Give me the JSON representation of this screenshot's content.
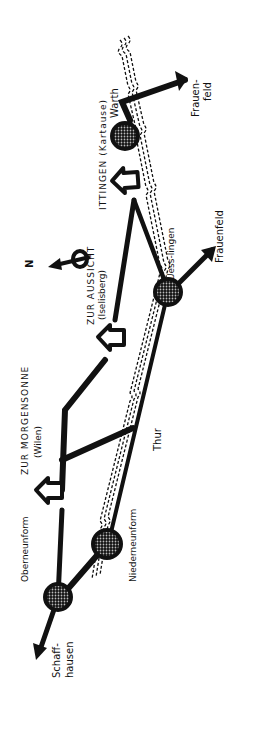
{
  "map": {
    "colors": {
      "ink": "#111111",
      "background": "#ffffff",
      "fill_pattern": "#888888"
    },
    "compass": {
      "label": "N",
      "icon": "north-arrow-icon"
    },
    "river": {
      "label": "Thur"
    },
    "towns": [
      {
        "id": "warth",
        "label": "Warth"
      },
      {
        "id": "uesslingen",
        "label": "Uess-lingen"
      },
      {
        "id": "niederneunforn",
        "label": "Niederneunform"
      },
      {
        "id": "oberneunforn",
        "label": "Oberneunform"
      }
    ],
    "destinations": [
      {
        "id": "frauenfeld-north",
        "label_line1": "Frauen-",
        "label_line2": "feld"
      },
      {
        "id": "frauenfeld-south",
        "label": "Frauenfeld"
      },
      {
        "id": "schaffhausen",
        "label_line1": "Schaff-",
        "label_line2": "hausen"
      }
    ],
    "inns": [
      {
        "id": "ittingen",
        "label_line1": "ITTINGEN (Kartause)",
        "label_line2": ""
      },
      {
        "id": "aussicht",
        "label_line1": "ZUR AUSSICHT",
        "label_line2": "(Iselisberg)"
      },
      {
        "id": "morgensonne",
        "label_line1": "ZUR MORGENSONNE",
        "label_line2": "(Wilen)"
      }
    ]
  }
}
